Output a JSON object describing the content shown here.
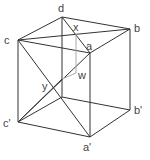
{
  "diagram": {
    "colors": {
      "edge": "#333333",
      "hidden": "#aaaaaa",
      "label": "#444444",
      "background": "#ffffff"
    },
    "vertices": {
      "a": {
        "label": "a",
        "x": 90,
        "y": 53
      },
      "b": {
        "label": "b",
        "x": 130,
        "y": 29
      },
      "c": {
        "label": "c",
        "x": 18,
        "y": 40
      },
      "d": {
        "label": "d",
        "x": 62,
        "y": 17
      },
      "a_prime": {
        "label": "a'",
        "x": 90,
        "y": 137
      },
      "b_prime": {
        "label": "b'",
        "x": 130,
        "y": 110
      },
      "c_prime": {
        "label": "c'",
        "x": 18,
        "y": 122
      },
      "d_prime": {
        "label": "",
        "x": 62,
        "y": 97
      }
    },
    "points": {
      "x": {
        "label": "x",
        "x": 76,
        "y": 34
      },
      "y": {
        "label": "y",
        "x": 54,
        "y": 88
      },
      "w": {
        "label": "w",
        "x": 76,
        "y": 73
      }
    }
  }
}
